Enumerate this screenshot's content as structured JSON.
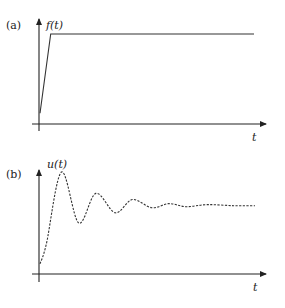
{
  "panels": [
    {
      "id": "a",
      "panel_label": "(a)",
      "y_label": "f(t)",
      "x_label": "t",
      "curve_style": "solid",
      "description": "ramp input rising quickly to a constant level"
    },
    {
      "id": "b",
      "panel_label": "(b)",
      "y_label": "u(t)",
      "x_label": "t",
      "curve_style": "dashed",
      "description": "underdamped oscillatory response settling to steady value"
    }
  ],
  "chart_data": [
    {
      "type": "line",
      "title": "(a)",
      "xlabel": "t",
      "ylabel": "f(t)",
      "series": [
        {
          "name": "f(t)",
          "points": [
            [
              0,
              0.12
            ],
            [
              0.05,
              1.0
            ],
            [
              1.0,
              1.0
            ]
          ]
        }
      ],
      "xlim": [
        0,
        1.0
      ],
      "ylim": [
        0,
        1.0
      ],
      "grid": false
    },
    {
      "type": "line",
      "title": "(b)",
      "xlabel": "t",
      "ylabel": "u(t)",
      "series": [
        {
          "name": "u(t)",
          "points": [
            [
              0,
              0.1
            ],
            [
              0.03,
              0.3
            ],
            [
              0.1,
              1.0
            ],
            [
              0.18,
              0.5
            ],
            [
              0.26,
              0.79
            ],
            [
              0.35,
              0.6
            ],
            [
              0.43,
              0.73
            ],
            [
              0.52,
              0.65
            ],
            [
              0.6,
              0.69
            ],
            [
              0.68,
              0.66
            ],
            [
              0.78,
              0.68
            ],
            [
              0.9,
              0.67
            ],
            [
              1.0,
              0.67
            ]
          ]
        }
      ],
      "xlim": [
        0,
        1.0
      ],
      "ylim": [
        0,
        1.0
      ],
      "grid": false
    }
  ]
}
